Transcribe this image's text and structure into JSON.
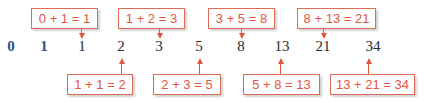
{
  "sequence": [
    "0",
    "1",
    "1",
    "2",
    "3",
    "5",
    "8",
    "13",
    "21",
    "34"
  ],
  "top_labels": [
    "0 + 1 = 1",
    "1 + 2 = 3",
    "3 + 5 = 8",
    "8 + 13 = 21"
  ],
  "bottom_labels": [
    "1 + 1 = 2",
    "2 + 3 = 5",
    "5 + 8 = 13",
    "13 + 21 = 34"
  ],
  "colors": {
    "accent": "#e2553e",
    "seed": "#2f4f86",
    "text": "#2a2a2a"
  }
}
